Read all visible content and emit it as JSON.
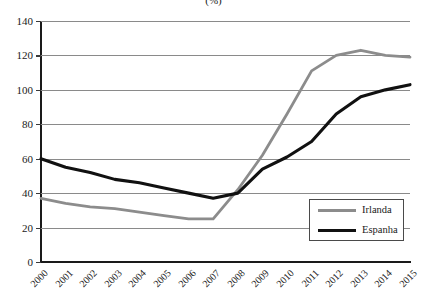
{
  "chart_data": {
    "type": "line",
    "title": "(%)",
    "xlabel": "",
    "ylabel": "",
    "x": [
      2000,
      2001,
      2002,
      2003,
      2004,
      2005,
      2006,
      2007,
      2008,
      2009,
      2010,
      2011,
      2012,
      2013,
      2014,
      2015
    ],
    "categories": [
      "2000",
      "2001",
      "2002",
      "2003",
      "2004",
      "2005",
      "2006",
      "2007",
      "2008",
      "2009",
      "2010",
      "2011",
      "2012",
      "2013",
      "2014",
      "2015"
    ],
    "ylim": [
      0,
      140
    ],
    "yticks": [
      0,
      20,
      40,
      60,
      80,
      100,
      120,
      140
    ],
    "ytick_labels": [
      "0",
      "20",
      "40",
      "60",
      "80",
      "100",
      "120",
      "140"
    ],
    "grid": true,
    "legend_position": "lower-right-inside",
    "series": [
      {
        "name": "Irlanda",
        "color": "#8c8c8c",
        "values": [
          37,
          34,
          32,
          31,
          29,
          27,
          25,
          25,
          42,
          62,
          86,
          111,
          120,
          123,
          120,
          119
        ]
      },
      {
        "name": "Espanha",
        "color": "#111111",
        "values": [
          60,
          55,
          52,
          48,
          46,
          43,
          40,
          37,
          40,
          54,
          61,
          70,
          86,
          96,
          100,
          103
        ]
      }
    ]
  },
  "legend": {
    "items": [
      {
        "label": "Irlanda",
        "color": "#8c8c8c"
      },
      {
        "label": "Espanha",
        "color": "#111111"
      }
    ]
  }
}
